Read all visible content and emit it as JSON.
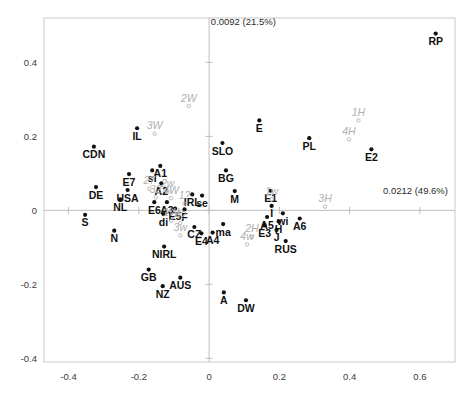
{
  "chart_data": {
    "type": "scatter",
    "title": "",
    "xlabel": "",
    "ylabel": "",
    "xlim": [
      -0.47,
      0.7
    ],
    "ylim": [
      -0.41,
      0.52
    ],
    "xticks": [
      "-0.4",
      "-0.2",
      "0",
      "0.2",
      "0.4",
      "0.6"
    ],
    "xtick_values": [
      -0.4,
      -0.2,
      0,
      0.2,
      0.4,
      0.6
    ],
    "yticks": [
      "0.4",
      "0.2",
      "0",
      "-0.2",
      "-0.4"
    ],
    "ytick_values": [
      0.4,
      0.2,
      0,
      -0.2,
      -0.4
    ],
    "grid": false,
    "legend": "none",
    "annotations": [
      {
        "name": "vertical-axis-eigenvalue",
        "text": "0.0092 (21.5%)",
        "x": 0.005,
        "y": 0.5,
        "align": "start"
      },
      {
        "name": "horizontal-axis-eigenvalue",
        "text": "0.0212 (49.6%)",
        "x": 0.68,
        "y": 0.045,
        "align": "end"
      }
    ],
    "series": [
      {
        "name": "countries",
        "marker": "filled-circle",
        "color": "#111111",
        "label_style": "bold",
        "points": [
          {
            "label": "RP",
            "x": 0.645,
            "y": 0.478
          },
          {
            "label": "E",
            "x": 0.143,
            "y": 0.243
          },
          {
            "label": "PL",
            "x": 0.285,
            "y": 0.195
          },
          {
            "label": "E2",
            "x": 0.462,
            "y": 0.165
          },
          {
            "label": "IL",
            "x": -0.205,
            "y": 0.222
          },
          {
            "label": "CDN",
            "x": -0.328,
            "y": 0.172
          },
          {
            "label": "SLO",
            "x": 0.038,
            "y": 0.182
          },
          {
            "label": "E7",
            "x": -0.228,
            "y": 0.098
          },
          {
            "label": "si",
            "x": -0.162,
            "y": 0.108
          },
          {
            "label": "A1",
            "x": -0.139,
            "y": 0.12
          },
          {
            "label": "DE",
            "x": -0.322,
            "y": 0.063
          },
          {
            "label": "USA",
            "x": -0.232,
            "y": 0.055
          },
          {
            "label": "A2",
            "x": -0.136,
            "y": 0.073
          },
          {
            "label": "BG",
            "x": 0.048,
            "y": 0.108
          },
          {
            "label": "M",
            "x": 0.073,
            "y": 0.052
          },
          {
            "label": "E1",
            "x": 0.175,
            "y": 0.053
          },
          {
            "label": "NL",
            "x": -0.253,
            "y": 0.03
          },
          {
            "label": "IRL",
            "x": -0.048,
            "y": 0.043
          },
          {
            "label": "se",
            "x": -0.02,
            "y": 0.04
          },
          {
            "label": "E6",
            "x": -0.156,
            "y": 0.022
          },
          {
            "label": "A3",
            "x": -0.12,
            "y": 0.022
          },
          {
            "label": "E5",
            "x": -0.097,
            "y": 0.005
          },
          {
            "label": "F",
            "x": -0.07,
            "y": 0.003
          },
          {
            "label": "S",
            "x": -0.353,
            "y": -0.012
          },
          {
            "label": "di",
            "x": -0.13,
            "y": -0.01
          },
          {
            "label": "I",
            "x": 0.178,
            "y": 0.012
          },
          {
            "label": "wi",
            "x": 0.21,
            "y": -0.008
          },
          {
            "label": "A5",
            "x": 0.165,
            "y": -0.018
          },
          {
            "label": "H",
            "x": 0.198,
            "y": -0.03
          },
          {
            "label": "A6",
            "x": 0.258,
            "y": -0.022
          },
          {
            "label": "E3",
            "x": 0.158,
            "y": -0.04
          },
          {
            "label": "J",
            "x": 0.192,
            "y": -0.053
          },
          {
            "label": "N",
            "x": -0.27,
            "y": -0.055
          },
          {
            "label": "CZ",
            "x": -0.042,
            "y": -0.045
          },
          {
            "label": "ma",
            "x": 0.04,
            "y": -0.037
          },
          {
            "label": "E4",
            "x": -0.022,
            "y": -0.062
          },
          {
            "label": "A4",
            "x": 0.01,
            "y": -0.06
          },
          {
            "label": "RUS",
            "x": 0.218,
            "y": -0.083
          },
          {
            "label": "NIRL",
            "x": -0.128,
            "y": -0.098
          },
          {
            "label": "GB",
            "x": -0.172,
            "y": -0.16
          },
          {
            "label": "AUS",
            "x": -0.082,
            "y": -0.182
          },
          {
            "label": "NZ",
            "x": -0.132,
            "y": -0.205
          },
          {
            "label": "A",
            "x": 0.042,
            "y": -0.222
          },
          {
            "label": "DW",
            "x": 0.105,
            "y": -0.243
          }
        ]
      },
      {
        "name": "haplogroups",
        "marker": "open-circle",
        "color": "#b0b0b0",
        "label_style": "italic",
        "points": [
          {
            "label": "2W",
            "x": -0.058,
            "y": 0.282
          },
          {
            "label": "3W",
            "x": -0.155,
            "y": 0.207
          },
          {
            "label": "1H",
            "x": 0.425,
            "y": 0.243
          },
          {
            "label": "4H",
            "x": 0.398,
            "y": 0.192
          },
          {
            "label": "1w",
            "x": 0.178,
            "y": 0.03
          },
          {
            "label": "3H",
            "x": 0.33,
            "y": 0.01
          },
          {
            "label": "27",
            "x": -0.17,
            "y": 0.058
          },
          {
            "label": "2w",
            "x": -0.118,
            "y": 0.05
          },
          {
            "label": "32",
            "x": -0.152,
            "y": 0.035
          },
          {
            "label": "4W",
            "x": -0.108,
            "y": 0.033
          },
          {
            "label": "1?",
            "x": -0.07,
            "y": 0.018
          },
          {
            "label": "1W",
            "x": -0.108,
            "y": -0.028
          },
          {
            "label": "4?",
            "x": -0.082,
            "y": -0.035
          },
          {
            "label": "3w",
            "x": -0.082,
            "y": -0.068
          },
          {
            "label": "2H",
            "x": 0.122,
            "y": -0.072
          },
          {
            "label": "4w",
            "x": 0.108,
            "y": -0.092
          }
        ]
      }
    ]
  }
}
